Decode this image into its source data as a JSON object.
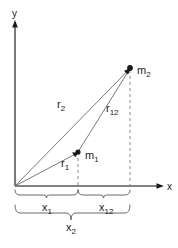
{
  "figure": {
    "background_color": "#ffffff",
    "line_color": "#6b6b6b",
    "axis_color": "#5a5a5a",
    "text_color": "#1a1a1a"
  },
  "axes": {
    "x_label": "x",
    "y_label": "y",
    "origin_label": ""
  },
  "points": [
    {
      "id": "m1",
      "base": "m",
      "subscript": "1",
      "label": "m1",
      "x": 78,
      "y": 152
    },
    {
      "id": "m2",
      "base": "m",
      "subscript": "2",
      "label": "m2",
      "x": 130,
      "y": 68
    }
  ],
  "vectors": [
    {
      "id": "r1",
      "base": "r",
      "subscript": "1",
      "label": "r1",
      "from": "origin",
      "to": "m1"
    },
    {
      "id": "r2",
      "base": "r",
      "subscript": "2",
      "label": "r2",
      "from": "origin",
      "to": "m2"
    },
    {
      "id": "r12",
      "base": "r",
      "subscript": "12",
      "label": "r12",
      "from": "m1",
      "to": "m2"
    }
  ],
  "distances": [
    {
      "id": "x1",
      "base": "x",
      "subscript": "1",
      "label": "x1",
      "span": "origin-to-m1-projection"
    },
    {
      "id": "x12",
      "base": "x",
      "subscript": "12",
      "label": "x12",
      "span": "m1-projection-to-m2-projection"
    },
    {
      "id": "x2",
      "base": "x",
      "subscript": "2",
      "label": "x2",
      "span": "origin-to-m2-projection"
    }
  ]
}
